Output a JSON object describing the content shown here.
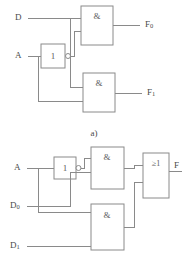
{
  "figure": {
    "captions": {
      "a": "a)",
      "b": "b)"
    }
  },
  "diagram_a": {
    "label": "Two AND gates with shared inverted address line",
    "inputs": [
      {
        "name": "D",
        "label": "D",
        "subscript": ""
      },
      {
        "name": "A",
        "label": "A",
        "subscript": ""
      }
    ],
    "outputs": [
      {
        "name": "F0",
        "label": "F",
        "subscript": "0"
      },
      {
        "name": "F1",
        "label": "F",
        "subscript": "1"
      }
    ],
    "gates": [
      {
        "name": "and-gate-top",
        "symbol": "&",
        "type": "AND"
      },
      {
        "name": "and-gate-bottom",
        "symbol": "&",
        "type": "AND"
      },
      {
        "name": "inverter",
        "symbol": "1",
        "type": "NOT"
      }
    ]
  },
  "diagram_b": {
    "label": "2-to-1 multiplexer built from two AND gates and an OR gate",
    "inputs": [
      {
        "name": "A",
        "label": "A",
        "subscript": ""
      },
      {
        "name": "D0",
        "label": "D",
        "subscript": "0"
      },
      {
        "name": "D1",
        "label": "D",
        "subscript": "1"
      }
    ],
    "outputs": [
      {
        "name": "F",
        "label": "F",
        "subscript": ""
      }
    ],
    "gates": [
      {
        "name": "and-gate-top",
        "symbol": "&",
        "type": "AND"
      },
      {
        "name": "and-gate-bottom",
        "symbol": "&",
        "type": "AND"
      },
      {
        "name": "or-gate",
        "symbol": "≥1",
        "type": "OR"
      },
      {
        "name": "inverter",
        "symbol": "1",
        "type": "NOT"
      }
    ]
  },
  "colors": {
    "wire": "#8a8a8a",
    "text": "#4a4a4a",
    "background": "#ffffff"
  }
}
